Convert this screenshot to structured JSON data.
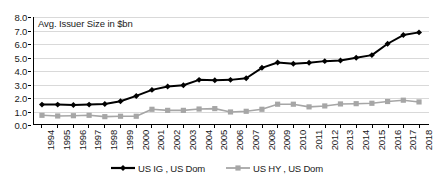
{
  "chart_data": {
    "type": "line",
    "title": "Avg. Issuer Size in $bn",
    "xlabel": "",
    "ylabel": "",
    "ylim": [
      0.0,
      8.0
    ],
    "ytick_step": 1.0,
    "grid": true,
    "legend_position": "bottom-center",
    "categories": [
      "1994",
      "1995",
      "1996",
      "1997",
      "1998",
      "1999",
      "2000",
      "2001",
      "2002",
      "2003",
      "2004",
      "2005",
      "2006",
      "2007",
      "2008",
      "2009",
      "2010",
      "2011",
      "2012",
      "2013",
      "2014",
      "2015",
      "2016",
      "2017",
      "2018"
    ],
    "ytick_labels": [
      "0.0",
      "1.0",
      "2.0",
      "3.0",
      "4.0",
      "5.0",
      "6.0",
      "7.0",
      "8.0"
    ],
    "ytick_values": [
      0.0,
      1.0,
      2.0,
      3.0,
      4.0,
      5.0,
      6.0,
      7.0,
      8.0
    ],
    "series": [
      {
        "name": "US IG , US Dom",
        "color": "#000000",
        "marker": "diamond",
        "values": [
          1.45,
          1.45,
          1.42,
          1.45,
          1.5,
          1.7,
          2.1,
          2.55,
          2.8,
          2.9,
          3.3,
          3.27,
          3.3,
          3.42,
          4.2,
          4.6,
          4.5,
          4.58,
          4.7,
          4.75,
          4.95,
          5.15,
          6.0,
          6.65,
          6.85
        ]
      },
      {
        "name": "US HY , US Dom",
        "color": "#a6a6a6",
        "marker": "square",
        "values": [
          0.65,
          0.6,
          0.62,
          0.65,
          0.55,
          0.58,
          0.58,
          1.1,
          1.02,
          1.02,
          1.12,
          1.15,
          0.9,
          0.95,
          1.1,
          1.48,
          1.48,
          1.28,
          1.35,
          1.5,
          1.52,
          1.55,
          1.68,
          1.78,
          1.65
        ]
      }
    ]
  },
  "legend": {
    "items": [
      {
        "label": "US IG , US Dom"
      },
      {
        "label": "US HY , US Dom"
      }
    ]
  }
}
